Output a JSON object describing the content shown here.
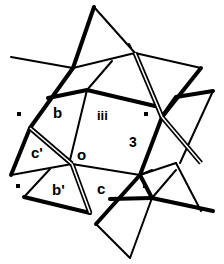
{
  "diagram": {
    "type": "geometric-tiling",
    "colors": {
      "stroke": "#000000",
      "background": "#ffffff"
    },
    "labels": {
      "b": "b",
      "iii": "iii",
      "c_prime": "c'",
      "o": "o",
      "three": "3",
      "b_prime": "b'",
      "c": "c"
    },
    "markers": [
      {
        "name": "square-marker-left-upper",
        "x": 19,
        "y": 114
      },
      {
        "name": "square-marker-right-upper",
        "x": 146,
        "y": 114
      },
      {
        "name": "square-marker-left-lower",
        "x": 18,
        "y": 186
      },
      {
        "name": "square-marker-right-lower",
        "x": 145,
        "y": 186
      }
    ]
  }
}
